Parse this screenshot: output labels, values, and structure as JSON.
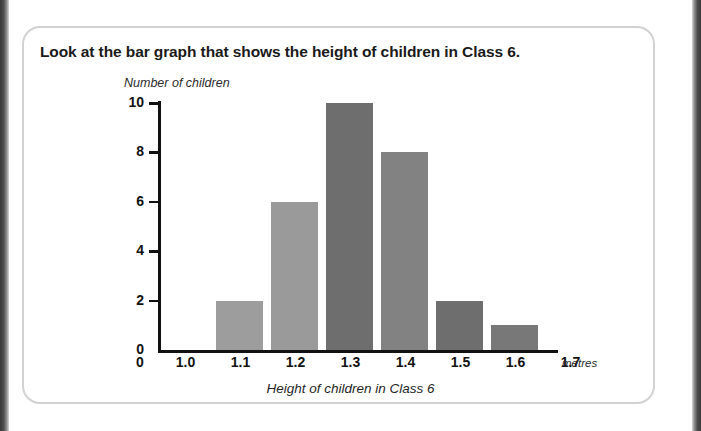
{
  "page": {
    "title": "Look at the bar graph that shows the height of children in Class 6.",
    "units_label": "metres",
    "background_color": "#ffffff",
    "card_border_color": "#d2d2d2"
  },
  "chart_data": {
    "type": "bar",
    "title": "",
    "xlabel": "Height of children in Class 6",
    "ylabel": "Number of children",
    "categories": [
      "1.1",
      "1.2",
      "1.3",
      "1.4",
      "1.5",
      "1.6"
    ],
    "values": [
      2,
      6,
      10,
      8,
      2,
      1
    ],
    "bar_colors": [
      "#9d9d9d",
      "#9a9a9a",
      "#6e6e6e",
      "#828282",
      "#6e6e6e",
      "#787878"
    ],
    "bin_edges": [
      "1.0",
      "1.1",
      "1.2",
      "1.3",
      "1.4",
      "1.5",
      "1.6",
      "1.7"
    ],
    "x_tick_labels": [
      "0",
      "1.0",
      "1.1",
      "1.2",
      "1.3",
      "1.4",
      "1.5",
      "1.6",
      "1.7"
    ],
    "y_tick_labels": [
      "0",
      "2",
      "4",
      "6",
      "8",
      "10"
    ],
    "y_ticks": [
      0,
      2,
      4,
      6,
      8,
      10
    ],
    "ylim": [
      0,
      10
    ],
    "x_units": "metres",
    "grid": false,
    "legend": "none",
    "axis_color": "#111111"
  }
}
